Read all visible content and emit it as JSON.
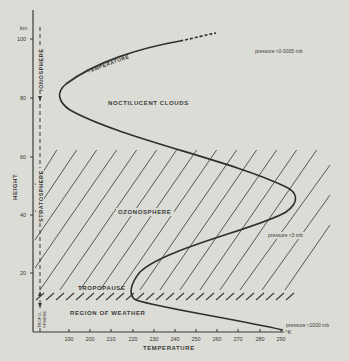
{
  "diagram": {
    "y_axis": {
      "unit": "km",
      "label": "HEIGHT",
      "ticks": [
        "100",
        "80",
        "60",
        "40",
        "20"
      ]
    },
    "x_axis": {
      "unit": "°K",
      "label": "TEMPERATURE",
      "ticks": [
        "190",
        "200",
        "210",
        "220",
        "230",
        "240",
        "250",
        "260",
        "270",
        "280",
        "290"
      ]
    },
    "layers": {
      "ionosphere": "IONOSPHERE",
      "stratosphere": "STRATOSPHERE",
      "troposphere": "TROPO-SPHERE"
    },
    "regions": {
      "noctilucent": "NOCTILUCENT CLOUDS",
      "ozonosphere": "OZONOSPHERE",
      "tropopause": "TROPOPAUSE",
      "weather": "REGION OF WEATHER"
    },
    "curve_label": "TEMPERATURE",
    "pressure_notes": {
      "top": "pressure ≈0·0005 mb",
      "mid": "pressure ≈3 mb",
      "bottom": "pressure ≈1000 mb"
    },
    "colors": {
      "background": "#dcdcd6",
      "ink": "#3a3a36"
    }
  }
}
